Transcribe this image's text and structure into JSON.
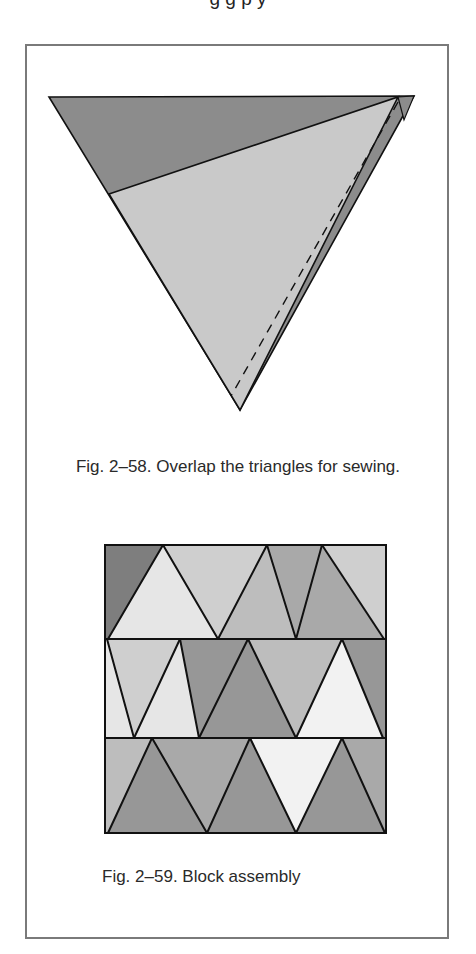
{
  "page": {
    "cropped_top_text": "g g p y"
  },
  "figure_58": {
    "caption": "Fig. 2–58. Overlap the triangles for sewing.",
    "colors": {
      "dark_triangle": "#8c8c8c",
      "light_triangle": "#c9c9c9",
      "outline": "#111111"
    },
    "dark_triangle_points": "49,97 414,96 240,410",
    "light_triangle_points": "109,194 398,97 240,410",
    "right_tip_points": "398,97 414,96 404,120",
    "dashed_line": {
      "x1": 398,
      "y1": 102,
      "x2": 231,
      "y2": 396
    }
  },
  "figure_59": {
    "caption": "Fig. 2–59. Block assembly",
    "block": {
      "x": 105,
      "y": 545,
      "width": 281,
      "height": 288
    },
    "row_dividers": [
      639,
      738
    ],
    "shades": {
      "d": "#7e7e7e",
      "md": "#979797",
      "m": "#a9a9a9",
      "ml": "#bdbdbd",
      "l": "#cfcfcf",
      "vl": "#e6e6e6",
      "w": "#f2f2f2"
    },
    "pieces": [
      {
        "points": "105,545 163,545 108,639 105,639",
        "shade": "d"
      },
      {
        "points": "163,545 108,639 218,639",
        "shade": "vl"
      },
      {
        "points": "163,545 267,545 218,639",
        "shade": "l"
      },
      {
        "points": "267,545 218,639 296,639",
        "shade": "ml"
      },
      {
        "points": "267,545 322,545 296,639",
        "shade": "m"
      },
      {
        "points": "322,545 296,639 384,639",
        "shade": "m"
      },
      {
        "points": "322,545 386,545 386,639 384,639",
        "shade": "l"
      },
      {
        "points": "105,639 107,639 134,738 105,738",
        "shade": "vl"
      },
      {
        "points": "107,639 180,639 134,738",
        "shade": "l"
      },
      {
        "points": "180,639 134,738 199,738",
        "shade": "vl"
      },
      {
        "points": "180,639 248,639 199,738",
        "shade": "l"
      },
      {
        "points": "180,639 248,639 296,738 199,738",
        "shade": "md"
      },
      {
        "points": "248,639 199,738 296,738",
        "shade": "md"
      },
      {
        "points": "248,639 342,639 296,738",
        "shade": "ml"
      },
      {
        "points": "342,639 296,738 383,738",
        "shade": "w"
      },
      {
        "points": "342,639 386,639 386,738 383,738",
        "shade": "md"
      },
      {
        "points": "105,738 152,738 108,833 105,833",
        "shade": "ml"
      },
      {
        "points": "152,738 108,833 207,833",
        "shade": "md"
      },
      {
        "points": "152,738 250,738 207,833",
        "shade": "m"
      },
      {
        "points": "250,738 207,833 296,833",
        "shade": "md"
      },
      {
        "points": "250,738 342,738 296,833",
        "shade": "w"
      },
      {
        "points": "342,738 296,833 385,833",
        "shade": "md"
      },
      {
        "points": "342,738 386,738 386,833 385,833",
        "shade": "m"
      }
    ],
    "lines": [
      "163,545 108,639",
      "163,545 218,639",
      "267,545 218,639",
      "267,545 296,639",
      "322,545 296,639",
      "322,545 384,639",
      "107,639 134,738",
      "180,639 134,738",
      "180,639 199,738",
      "248,639 199,738",
      "248,639 296,738",
      "342,639 296,738",
      "342,639 383,738",
      "152,738 108,833",
      "152,738 207,833",
      "250,738 207,833",
      "250,738 296,833",
      "342,738 296,833",
      "342,738 385,833"
    ]
  }
}
